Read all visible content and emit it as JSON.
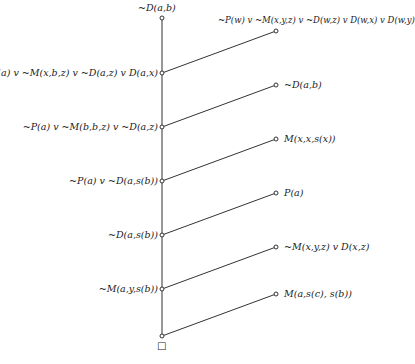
{
  "diagram": {
    "root": {
      "label": "~D(a,b)"
    },
    "trunk_nodes": [
      {
        "label": "~P(a) v ~M(x,b,z) v ~D(a,z) v D(a,x)"
      },
      {
        "label": "~P(a) v ~M(b,b,z) v ~D(a,z)"
      },
      {
        "label": "~P(a) v ~D(a,s(b))"
      },
      {
        "label": "~D(a,s(b))"
      },
      {
        "label": "~M(a,y,s(b))"
      },
      {
        "label": "□"
      }
    ],
    "side_clauses": [
      {
        "label": "~P(w) v ~M(x,y,z) v ~D(w,z) v D(w,x) v D(w,y)"
      },
      {
        "label": "~D(a,b)"
      },
      {
        "label": "M(x,x,s(x))"
      },
      {
        "label": "P(a)"
      },
      {
        "label": "~M(x,y,z) v D(x,z)"
      },
      {
        "label": "M(a,s(c), s(b))"
      }
    ]
  }
}
